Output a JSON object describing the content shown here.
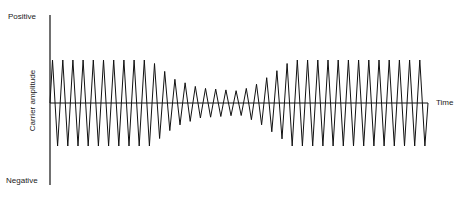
{
  "labels": {
    "positive": "Positive",
    "negative": "Negative",
    "y_axis": "Carrier amplitude",
    "x_axis": "Time"
  },
  "axes": {
    "origin_x": 50,
    "y_top": 15,
    "y_bottom": 185,
    "baseline_y": 103,
    "x_end": 428
  },
  "waveform": {
    "description": "Carrier wave with constant amplitude, then pinched (reduced) amplitude in the middle, then constant amplitude again",
    "period_px": 10.2,
    "start_x": 50,
    "end_x": 428,
    "full_amplitude_top": 60,
    "full_amplitude_bottom": 146,
    "amplitude_envelope": [
      {
        "x": 50,
        "a": 1.0
      },
      {
        "x": 150,
        "a": 1.0
      },
      {
        "x": 175,
        "a": 0.55
      },
      {
        "x": 200,
        "a": 0.35
      },
      {
        "x": 240,
        "a": 0.28
      },
      {
        "x": 258,
        "a": 0.45
      },
      {
        "x": 280,
        "a": 0.8
      },
      {
        "x": 292,
        "a": 1.0
      },
      {
        "x": 428,
        "a": 1.0
      }
    ]
  },
  "colors": {
    "line": "#111111",
    "text": "#222222",
    "background": "#ffffff"
  }
}
